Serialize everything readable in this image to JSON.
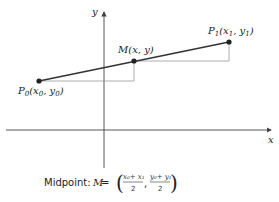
{
  "diagram": {
    "axes": {
      "x_label": "x",
      "y_label": "y"
    },
    "points": {
      "p0": {
        "name": "P",
        "sub": "0",
        "coords_open": "(x",
        "coords_sub1": "0",
        "coords_mid": ", y",
        "coords_sub2": "0",
        "coords_close": ")"
      },
      "m": {
        "label": "M(x, y)"
      },
      "p1": {
        "name": "P",
        "sub": "1",
        "coords_open": "(x",
        "coords_sub1": "1",
        "coords_mid": ", y",
        "coords_sub2": "1",
        "coords_close": ")"
      }
    },
    "caption": {
      "prefix": "Midpoint: ",
      "variable": "M",
      "equals": " =",
      "frac1_num": "x₀+ x₁",
      "frac1_den": "2",
      "comma": ",",
      "frac2_num": "y₀+ y₁",
      "frac2_den": "2",
      "open_paren": "(",
      "close_paren": ")"
    },
    "colors": {
      "segment": "#333333",
      "guides": "#999999",
      "axes": "#444444"
    }
  }
}
